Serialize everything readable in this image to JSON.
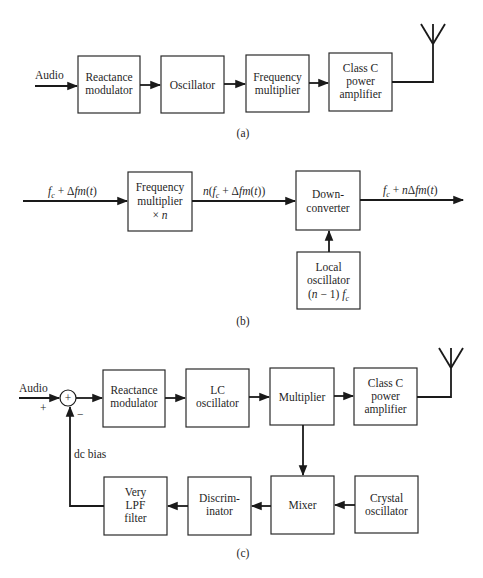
{
  "diagram_a": {
    "caption": "(a)",
    "input_label": "Audio",
    "blocks": [
      {
        "id": "reactance-modulator",
        "lines": [
          "Reactance",
          "modulator"
        ]
      },
      {
        "id": "oscillator",
        "lines": [
          "Oscillator"
        ]
      },
      {
        "id": "frequency-multiplier",
        "lines": [
          "Frequency",
          "multiplier"
        ]
      },
      {
        "id": "class-c-amplifier",
        "lines": [
          "Class C",
          "power",
          "amplifier"
        ]
      }
    ],
    "output": "antenna"
  },
  "diagram_b": {
    "caption": "(b)",
    "input_label": "f_c + Δfm(t)",
    "mid_label": "n(f_c + Δfm(t))",
    "output_label": "f_c + nΔfm(t)",
    "blocks": [
      {
        "id": "frequency-multiplier-n",
        "lines": [
          "Frequency",
          "multiplier",
          "× n"
        ]
      },
      {
        "id": "down-converter",
        "lines": [
          "Down-",
          "converter"
        ]
      },
      {
        "id": "local-oscillator",
        "lines": [
          "Local",
          "oscillator",
          "(n − 1) f_c"
        ]
      }
    ]
  },
  "diagram_c": {
    "caption": "(c)",
    "input_label": "Audio",
    "plus_sign": "+",
    "minus_sign": "−",
    "summer_symbol": "+",
    "feedback_label": "dc bias",
    "blocks": [
      {
        "id": "reactance-modulator",
        "lines": [
          "Reactance",
          "modulator"
        ]
      },
      {
        "id": "lc-oscillator",
        "lines": [
          "LC",
          "oscillator"
        ]
      },
      {
        "id": "multiplier",
        "lines": [
          "Multiplier"
        ]
      },
      {
        "id": "class-c-amplifier",
        "lines": [
          "Class C",
          "power",
          "amplifier"
        ]
      },
      {
        "id": "mixer",
        "lines": [
          "Mixer"
        ]
      },
      {
        "id": "crystal-oscillator",
        "lines": [
          "Crystal",
          "oscillator"
        ]
      },
      {
        "id": "discriminator",
        "lines": [
          "Discrim-",
          "inator"
        ]
      },
      {
        "id": "very-lpf-filter",
        "lines": [
          "Very",
          "LPF",
          "filter"
        ]
      }
    ],
    "output": "antenna"
  }
}
